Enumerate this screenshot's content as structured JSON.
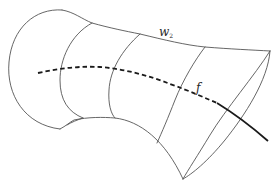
{
  "figure": {
    "type": "surface-sketch",
    "colors": {
      "outline": "#555555",
      "curve_f": "#1a1a1a",
      "background": "#ffffff"
    }
  },
  "labels": {
    "surface": {
      "base": "w",
      "subscript": "2"
    },
    "curve": "f"
  }
}
